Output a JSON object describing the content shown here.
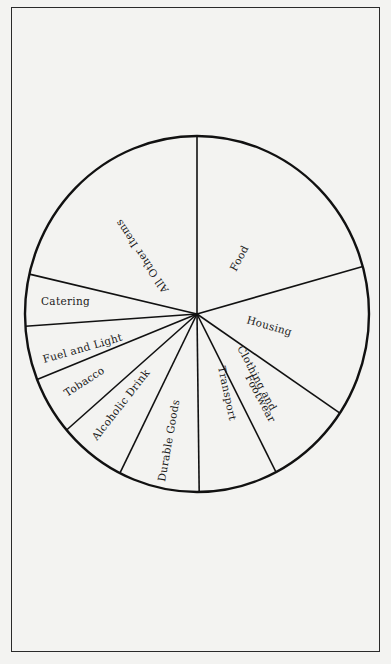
{
  "chart_data": {
    "type": "pie",
    "title": "",
    "start_angle_deg": 0,
    "direction": "clockwise",
    "categories": [
      "Food",
      "Housing",
      "Clothing and Footwear",
      "Transport",
      "Durable Goods",
      "Alcoholic Drink",
      "Tobacco",
      "Fuel and Light",
      "Catering",
      "All Other Items"
    ],
    "values": [
      20.7,
      13.7,
      8.0,
      7.4,
      7.6,
      6.3,
      5.3,
      4.9,
      4.7,
      21.4
    ],
    "unit": "percent (estimated from slice angles)",
    "legend": "none (labels inside slices)"
  },
  "labels": {
    "food": "Food",
    "housing": "Housing",
    "clothing_line1": "Clothing and",
    "clothing_line2": "Footwear",
    "transport": "Transport",
    "durable": "Durable Goods",
    "alcoholic": "Alcoholic Drink",
    "tobacco": "Tobacco",
    "fuel": "Fuel and Light",
    "catering": "Catering",
    "all_other": "All Other Items"
  },
  "colors": {
    "background": "#f3f3f1",
    "line": "#111111",
    "text": "#1a1a1a"
  }
}
